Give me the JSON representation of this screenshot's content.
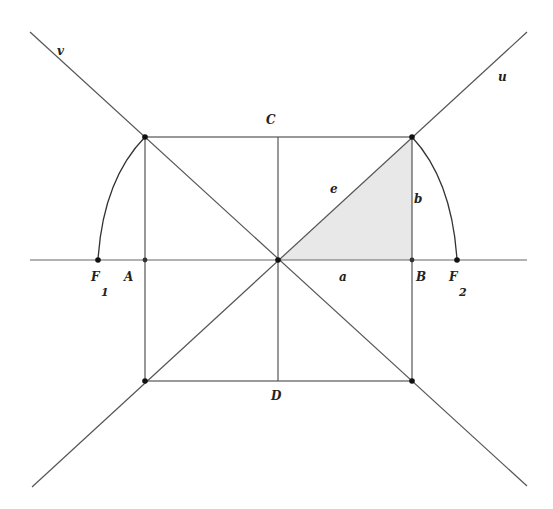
{
  "diagram": {
    "type": "hyperbola-asymptote-construction",
    "colors": {
      "line": "#555555",
      "point": "#111111",
      "fill": "#e6e6e6",
      "background": "#ffffff"
    },
    "labels": {
      "v": "v",
      "u": "u",
      "C": "C",
      "D": "D",
      "A": "A",
      "B": "B",
      "e": "e",
      "a": "a",
      "b": "b",
      "F1": "F",
      "F1_sub": "1",
      "F2": "F",
      "F2_sub": "2"
    },
    "points": {
      "center": [
        278,
        260
      ],
      "top_left": [
        145,
        137
      ],
      "top_right": [
        412,
        137
      ],
      "bottom_left": [
        145,
        381
      ],
      "bottom_right": [
        412,
        381
      ],
      "A": [
        145,
        260
      ],
      "B": [
        412,
        260
      ],
      "F1": [
        98,
        260
      ],
      "F2": [
        457,
        260
      ]
    }
  }
}
